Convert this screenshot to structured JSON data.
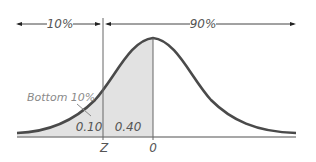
{
  "diagram": {
    "type": "normal-distribution",
    "top_labels": {
      "left_pct": "10%",
      "right_pct": "90%"
    },
    "annotation": "Bottom 10%",
    "areas": {
      "left_tail": "0.10",
      "middle": "0.40"
    },
    "axis_labels": {
      "z": "Z",
      "zero": "0"
    },
    "colors": {
      "curve": "#4a4a4a",
      "shade": "#e2e2e2",
      "text": "#555555",
      "annotation": "#8a8a8a"
    }
  }
}
